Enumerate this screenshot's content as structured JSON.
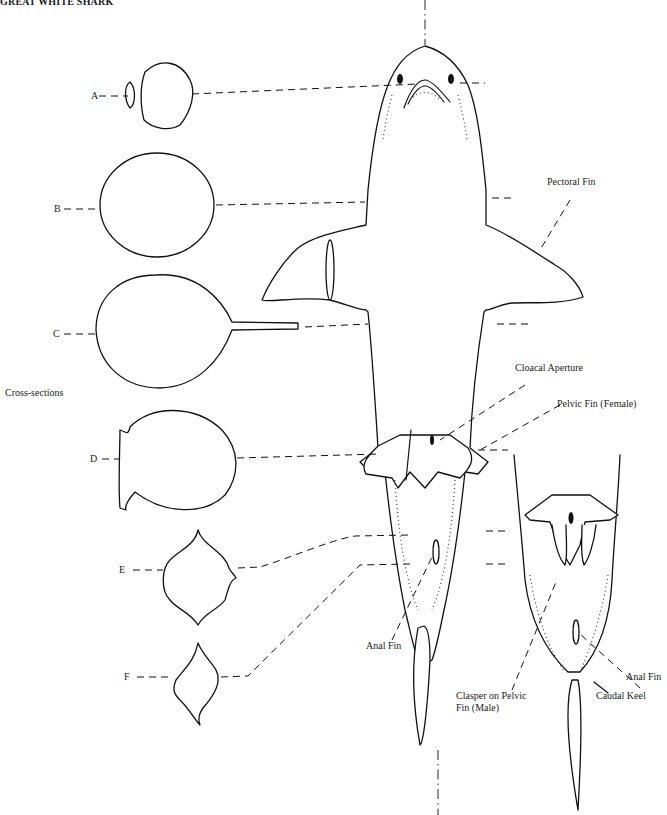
{
  "title": "GREAT WHITE SHARK",
  "group_label": "Cross-sections",
  "cross_sections": [
    {
      "id": "A",
      "label": "A"
    },
    {
      "id": "B",
      "label": "B"
    },
    {
      "id": "C",
      "label": "C"
    },
    {
      "id": "D",
      "label": "D"
    },
    {
      "id": "E",
      "label": "E"
    },
    {
      "id": "F",
      "label": "F"
    }
  ],
  "annotations": {
    "pectoral_fin": "Pectoral Fin",
    "cloacal_aperture": "Cloacal Aperture",
    "pelvic_fin_female": "Pelvic Fin (Female)",
    "anal_fin_main": "Anal Fin",
    "clasper_line1": "Clasper on Pelvic",
    "clasper_line2": "Fin (Male)",
    "anal_fin_male": "Anal Fin",
    "caudal_keel": "Caudal Keel"
  },
  "views": {
    "main": "ventral view of shark (female)",
    "inset": "ventral view of male posterior"
  }
}
